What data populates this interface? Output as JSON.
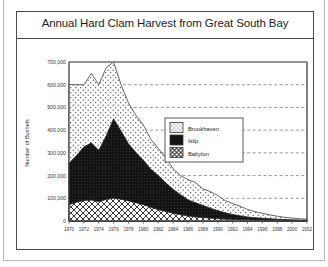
{
  "chart_data": {
    "type": "area",
    "stacked": true,
    "title": "Annual Hard Clam Harvest from Great South Bay",
    "xlabel": "",
    "ylabel": "Number of Bushels",
    "ylim": [
      0,
      700000
    ],
    "xlim": [
      1970,
      2002
    ],
    "grid": true,
    "grid_style": "dashed-horizontal",
    "legend_position": "center-right",
    "y_ticks": [
      0,
      100000,
      200000,
      300000,
      400000,
      500000,
      600000,
      700000
    ],
    "y_tick_labels": [
      "0",
      "100,000",
      "200,000",
      "300,000",
      "400,000",
      "500,000",
      "600,000",
      "700,000"
    ],
    "x_ticks": [
      1970,
      1972,
      1974,
      1976,
      1978,
      1980,
      1982,
      1984,
      1986,
      1988,
      1990,
      1992,
      1994,
      1996,
      1998,
      2000,
      2002
    ],
    "x_tick_labels": [
      "1970",
      "1972",
      "1974",
      "1976",
      "1978",
      "1980",
      "1982",
      "1984",
      "1986",
      "1988",
      "1990",
      "1992",
      "1994",
      "1996",
      "1998",
      "2000",
      "2002"
    ],
    "x": [
      1970,
      1971,
      1972,
      1973,
      1974,
      1975,
      1976,
      1977,
      1978,
      1979,
      1980,
      1981,
      1982,
      1983,
      1984,
      1985,
      1986,
      1987,
      1988,
      1989,
      1990,
      1991,
      1992,
      1993,
      1994,
      1995,
      1996,
      1997,
      1998,
      1999,
      2000,
      2001,
      2002
    ],
    "series": [
      {
        "name": "Babylon",
        "pattern": "cross-hatch",
        "color": "#ffffff",
        "values": [
          72000,
          82000,
          90000,
          92000,
          85000,
          95000,
          100000,
          96000,
          88000,
          80000,
          72000,
          60000,
          50000,
          42000,
          34000,
          28000,
          22000,
          18000,
          15000,
          12000,
          10000,
          8000,
          7000,
          6000,
          5000,
          4500,
          4000,
          3500,
          3000,
          2500,
          2000,
          1800,
          1500
        ]
      },
      {
        "name": "Islip",
        "pattern": "solid-black",
        "color": "#131313",
        "values": [
          182000,
          206000,
          236000,
          252000,
          226000,
          280000,
          350000,
          300000,
          252000,
          222000,
          196000,
          168000,
          150000,
          126000,
          106000,
          88000,
          72000,
          62000,
          54000,
          44000,
          36000,
          28000,
          22000,
          17000,
          13000,
          10000,
          8000,
          6500,
          5000,
          4000,
          3000,
          2500,
          2000
        ]
      },
      {
        "name": "Brookhaven",
        "pattern": "dotted",
        "color": "#ffffff",
        "values": [
          346000,
          312000,
          274000,
          306000,
          289000,
          300000,
          250000,
          204000,
          180000,
          163000,
          154000,
          132000,
          120000,
          112000,
          90000,
          84000,
          88000,
          90000,
          72000,
          74000,
          66000,
          54000,
          48000,
          42000,
          33000,
          27000,
          22000,
          17000,
          13000,
          10000,
          8000,
          6000,
          4500
        ]
      }
    ],
    "totals": [
      600000,
      600000,
      600000,
      650000,
      600000,
      675000,
      700000,
      600000,
      520000,
      465000,
      422000,
      360000,
      320000,
      280000,
      230000,
      200000,
      182000,
      170000,
      141000,
      130000,
      112000,
      90000,
      77000,
      65000,
      51000,
      41500,
      34000,
      27000,
      21000,
      16500,
      13000,
      10300,
      8000
    ]
  },
  "legend": {
    "items": [
      {
        "label": "Brookhaven",
        "swatch": "dotted"
      },
      {
        "label": "Islip",
        "swatch": "solid-black"
      },
      {
        "label": "Babylon",
        "swatch": "cross-hatch"
      }
    ]
  },
  "colors": {
    "frame": "#4a4a4a",
    "islip_fill": "#131313",
    "outline": "#555555",
    "grid": "#6d6d6d",
    "background": "#ffffff"
  }
}
